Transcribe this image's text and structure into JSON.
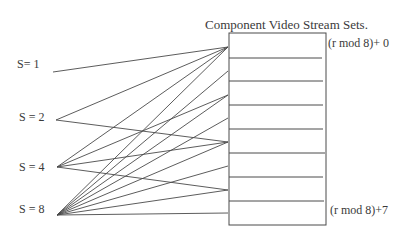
{
  "title": "Component Video Stream Sets.",
  "sources": [
    {
      "label": "S= 1",
      "y": 72,
      "x": 53,
      "targets": [
        0
      ]
    },
    {
      "label": "S = 2",
      "y": 120,
      "x": 56,
      "targets": [
        0,
        4
      ]
    },
    {
      "label": "S = 4",
      "y": 167,
      "x": 57,
      "targets": [
        0,
        2,
        4,
        6
      ]
    },
    {
      "label": "S = 8",
      "y": 215,
      "x": 57,
      "targets": [
        0,
        1,
        2,
        3,
        4,
        5,
        6,
        7
      ]
    }
  ],
  "slots": {
    "count": 8,
    "first_label": "(r mod 8)+ 0",
    "last_label": "(r mod 8)+7"
  },
  "colors": {
    "line": "#4a4a4a",
    "text": "#3a3a3a"
  }
}
